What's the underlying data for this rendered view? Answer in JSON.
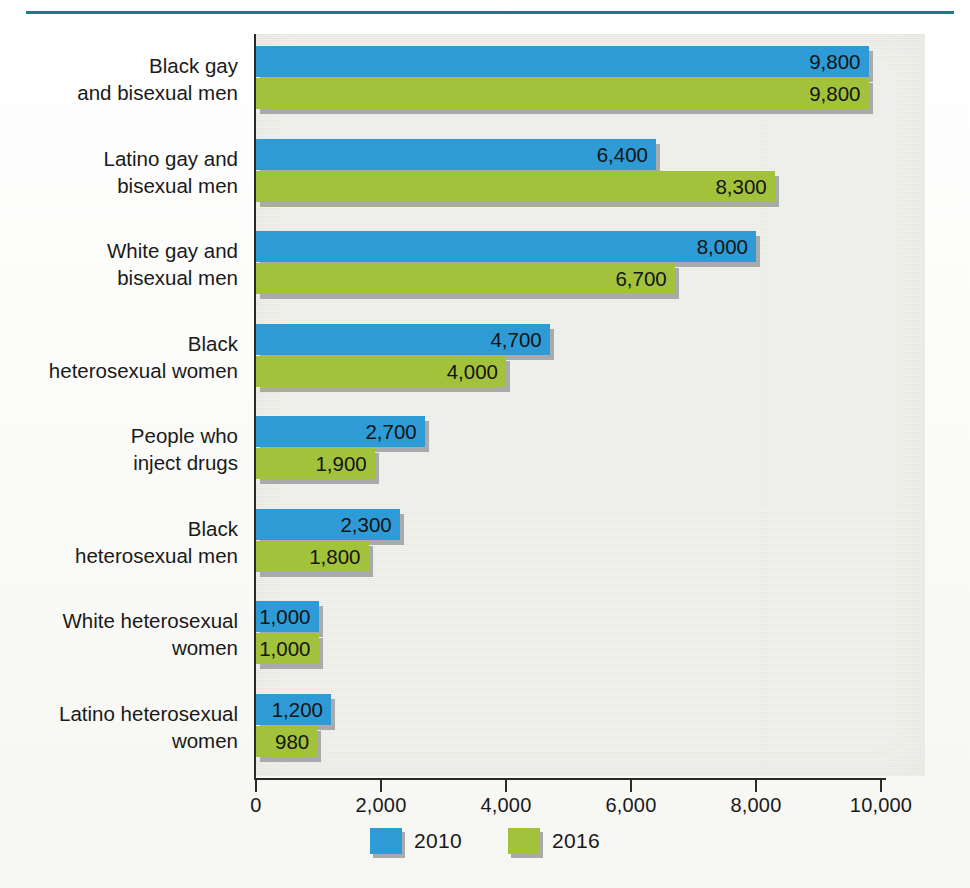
{
  "figure": {
    "accent_rule_color": "#1f7a87",
    "panel_background": "#eceee7"
  },
  "legend": {
    "position": "bottom-center",
    "entries": [
      {
        "label": "2010",
        "color": "#2e9bd6",
        "name": "legend-2010"
      },
      {
        "label": "2016",
        "color": "#a3c23c",
        "name": "legend-2016"
      }
    ]
  },
  "axis": {
    "x_ticks": [
      "0",
      "2,000",
      "4,000",
      "6,000",
      "8,000",
      "10,000"
    ]
  },
  "chart_data": {
    "type": "bar",
    "orientation": "horizontal",
    "title": "",
    "xlabel": "",
    "ylabel": "",
    "xlim": [
      0,
      10000
    ],
    "xticks": [
      0,
      2000,
      4000,
      6000,
      8000,
      10000
    ],
    "grid": false,
    "legend_position": "bottom-center",
    "categories": [
      "Black gay\nand bisexual men",
      "Latino gay and\nbisexual men",
      "White gay and\nbisexual men",
      "Black\nheterosexual women",
      "People who\ninject drugs",
      "Black\nheterosexual men",
      "White heterosexual\nwomen",
      "Latino heterosexual\nwomen"
    ],
    "series": [
      {
        "name": "2010",
        "color": "#2e9bd6",
        "values": [
          9800,
          6400,
          8000,
          4700,
          2700,
          2300,
          1000,
          1200
        ],
        "labels": [
          "9,800",
          "6,400",
          "8,000",
          "4,700",
          "2,700",
          "2,300",
          "1,000",
          "1,200"
        ]
      },
      {
        "name": "2016",
        "color": "#a3c23c",
        "values": [
          9800,
          8300,
          6700,
          4000,
          1900,
          1800,
          1000,
          980
        ],
        "labels": [
          "9,800",
          "8,300",
          "6,700",
          "4,000",
          "1,900",
          "1,800",
          "1,000",
          "980"
        ]
      }
    ]
  }
}
